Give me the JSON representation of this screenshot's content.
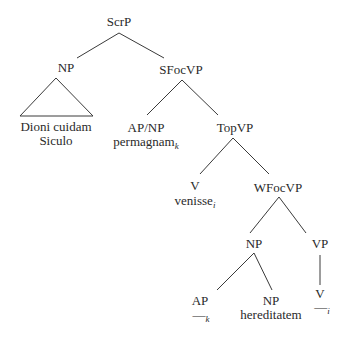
{
  "diagram": {
    "type": "syntax-tree",
    "nodes": {
      "root": {
        "label": "ScrP"
      },
      "np_subject": {
        "label": "NP",
        "content_line1": "Dioni cuidam",
        "content_line2": "Siculo"
      },
      "sfocvp": {
        "label": "SFocVP"
      },
      "apnp": {
        "label": "AP/NP",
        "word": "permagnam",
        "index": "k"
      },
      "topvp": {
        "label": "TopVP"
      },
      "v_moved": {
        "label": "V",
        "word": "venisse",
        "index": "i"
      },
      "wfocvp": {
        "label": "WFocVP"
      },
      "np_object": {
        "label": "NP"
      },
      "vp": {
        "label": "VP"
      },
      "ap_trace": {
        "label": "AP",
        "trace": "—",
        "index": "k"
      },
      "np_noun": {
        "label": "NP",
        "word": "hereditatem"
      },
      "v_trace": {
        "label": "V",
        "trace": "—",
        "index": "i"
      }
    },
    "edges": [
      [
        "ScrP",
        "NP"
      ],
      [
        "ScrP",
        "SFocVP"
      ],
      [
        "SFocVP",
        "AP/NP"
      ],
      [
        "SFocVP",
        "TopVP"
      ],
      [
        "TopVP",
        "V"
      ],
      [
        "TopVP",
        "WFocVP"
      ],
      [
        "WFocVP",
        "NP"
      ],
      [
        "WFocVP",
        "VP"
      ],
      [
        "NP",
        "AP"
      ],
      [
        "NP",
        "NP"
      ],
      [
        "VP",
        "V"
      ]
    ]
  }
}
